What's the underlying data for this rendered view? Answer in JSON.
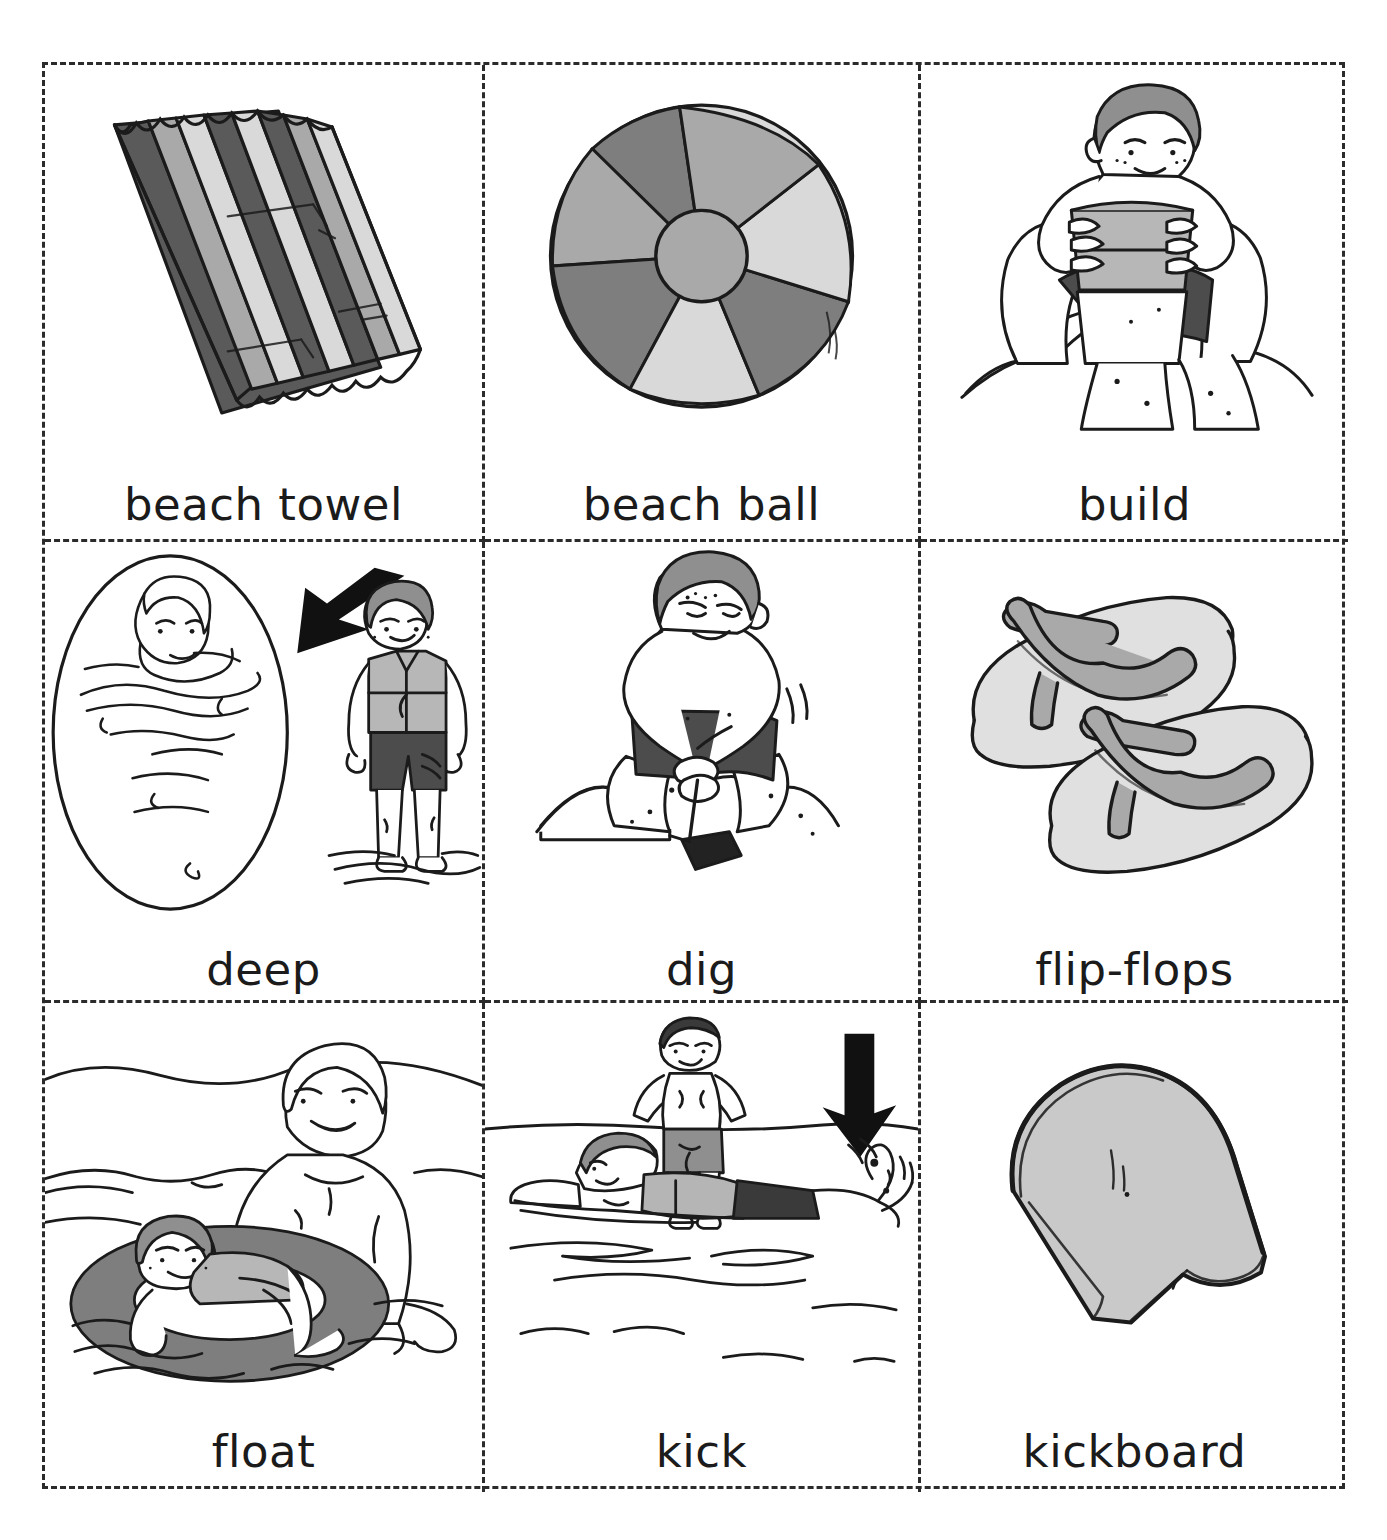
{
  "sheet": {
    "title": "Beach vocabulary picture cards",
    "border_style": "dashed",
    "border_color": "#2b2b2b",
    "background": "#ffffff",
    "columns": 3,
    "rows": 3
  },
  "palette": {
    "ink": "#1b1b1b",
    "gray_light": "#d9d9d9",
    "gray_mid": "#a9a9a9",
    "gray_dark": "#7e7e7e",
    "gray_darker": "#5a5a5a",
    "skin": "#ffffff",
    "hair": "#8f8f8f",
    "arrow": "#111111"
  },
  "cards": [
    {
      "id": "beach-towel",
      "label": "beach towel",
      "icon": "striped-beach-towel-illustration",
      "row": 1,
      "col": 1,
      "colors": [
        "#5a5a5a",
        "#a9a9a9",
        "#d9d9d9"
      ]
    },
    {
      "id": "beach-ball",
      "label": "beach ball",
      "icon": "beach-ball-illustration",
      "row": 1,
      "col": 2,
      "colors": [
        "#d9d9d9",
        "#a9a9a9",
        "#7e7e7e"
      ]
    },
    {
      "id": "build",
      "label": "build",
      "icon": "boy-building-sandcastle-illustration",
      "row": 1,
      "col": 3,
      "colors": [
        "#8f8f8f",
        "#b7b7b7",
        "#5a5a5a"
      ]
    },
    {
      "id": "deep",
      "label": "deep",
      "icon": "deep-water-comparison-illustration",
      "row": 2,
      "col": 1,
      "has_arrow": true,
      "arrow_direction": "down-left",
      "colors": [
        "#8f8f8f",
        "#a9a9a9",
        "#4c4c4c"
      ]
    },
    {
      "id": "dig",
      "label": "dig",
      "icon": "boy-digging-sand-illustration",
      "row": 2,
      "col": 2,
      "colors": [
        "#8f8f8f",
        "#4c4c4c",
        "#222222"
      ]
    },
    {
      "id": "flip-flops",
      "label": "flip-flops",
      "icon": "flip-flops-illustration",
      "row": 2,
      "col": 3,
      "colors": [
        "#e0e0e0",
        "#a9a9a9"
      ]
    },
    {
      "id": "float",
      "label": "float",
      "icon": "boy-floating-in-inner-tube-illustration",
      "row": 3,
      "col": 1,
      "colors": [
        "#7e7e7e",
        "#8f8f8f",
        "#c9c9c9"
      ]
    },
    {
      "id": "kick",
      "label": "kick",
      "icon": "swimmers-kicking-illustration",
      "row": 3,
      "col": 2,
      "has_arrow": true,
      "arrow_direction": "down",
      "colors": [
        "#8f8f8f",
        "#3a3a3a",
        "#b5b5b5"
      ]
    },
    {
      "id": "kickboard",
      "label": "kickboard",
      "icon": "kickboard-illustration",
      "row": 3,
      "col": 3,
      "colors": [
        "#c9c9c9"
      ]
    }
  ]
}
